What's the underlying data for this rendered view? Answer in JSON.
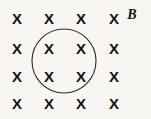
{
  "figure": {
    "background_color": "#f7f6f3",
    "ink_color": "#15140f",
    "stroke_color": "#2b2a26",
    "width": 151,
    "height": 119
  },
  "field_label": {
    "text": "B",
    "style": "bold-italic-serif",
    "x": 132,
    "y": 14
  },
  "field_markers": {
    "symbol": "X",
    "meaning": "magnetic-field-into-page",
    "rows": 4,
    "columns": 4,
    "column_x": [
      17,
      49,
      81,
      114
    ],
    "row_y": [
      18,
      48,
      76,
      103
    ],
    "cells": [
      {
        "symbol": "X",
        "x": 17,
        "y": 18,
        "inside_loop": false
      },
      {
        "symbol": "X",
        "x": 49,
        "y": 18,
        "inside_loop": false
      },
      {
        "symbol": "X",
        "x": 81,
        "y": 18,
        "inside_loop": false
      },
      {
        "symbol": "X",
        "x": 114,
        "y": 18,
        "inside_loop": false
      },
      {
        "symbol": "X",
        "x": 17,
        "y": 48,
        "inside_loop": false
      },
      {
        "symbol": "X",
        "x": 49,
        "y": 48,
        "inside_loop": true
      },
      {
        "symbol": "X",
        "x": 81,
        "y": 48,
        "inside_loop": true
      },
      {
        "symbol": "X",
        "x": 114,
        "y": 48,
        "inside_loop": false
      },
      {
        "symbol": "X",
        "x": 17,
        "y": 76,
        "inside_loop": false
      },
      {
        "symbol": "X",
        "x": 49,
        "y": 76,
        "inside_loop": true
      },
      {
        "symbol": "X",
        "x": 81,
        "y": 76,
        "inside_loop": true
      },
      {
        "symbol": "X",
        "x": 114,
        "y": 76,
        "inside_loop": false
      },
      {
        "symbol": "X",
        "x": 17,
        "y": 103,
        "inside_loop": false
      },
      {
        "symbol": "X",
        "x": 49,
        "y": 103,
        "inside_loop": false
      },
      {
        "symbol": "X",
        "x": 81,
        "y": 103,
        "inside_loop": false
      },
      {
        "symbol": "X",
        "x": 114,
        "y": 103,
        "inside_loop": false
      }
    ]
  },
  "loop": {
    "shape": "circle",
    "center_x": 64,
    "center_y": 61,
    "radius": 32,
    "stroke_width": 1.1
  }
}
